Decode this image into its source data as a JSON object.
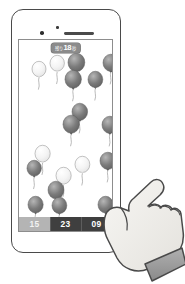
{
  "scene": {
    "device": "smartphone",
    "orientation": "portrait",
    "illustration_style": "grayscale line drawing"
  },
  "phone": {
    "sensor_icon": "proximity-sensor-dot",
    "camera_icon": "front-camera-dot",
    "speaker_icon": "earpiece-speaker-grille"
  },
  "game": {
    "title": "balloon-popping-game",
    "timer": {
      "label": "残り",
      "value": "18",
      "unit": "秒",
      "badge_color": "#8b8b8b",
      "text_color": "#ffffff"
    },
    "score_bar": {
      "background": "#3f3f3f",
      "cells": [
        {
          "value": "15",
          "state": "inactive",
          "background": "#b4b4b4"
        },
        {
          "value": "23",
          "state": "active",
          "background": "#3f3f3f"
        },
        {
          "value": "09",
          "state": "active",
          "background": "#3f3f3f"
        }
      ]
    },
    "balloon_colors": {
      "dark": "#7b7b7b",
      "dark_shade": "#5e5e5e",
      "light": "#f4f4f4",
      "light_shade": "#e2e2e2",
      "outline": "#9a9a9a",
      "string": "#a8a8a8"
    },
    "balloon_count": 21,
    "balloons": [
      {
        "id": "b01",
        "x": 13,
        "y": 22,
        "r": 7.0,
        "tone": "light"
      },
      {
        "id": "b02",
        "x": 31,
        "y": 16,
        "r": 7.2,
        "tone": "light"
      },
      {
        "id": "b03",
        "x": 49,
        "y": 14,
        "r": 8.4,
        "tone": "dark"
      },
      {
        "id": "b04",
        "x": 46,
        "y": 31,
        "r": 8.2,
        "tone": "dark"
      },
      {
        "id": "b05",
        "x": 69,
        "y": 32,
        "r": 7.4,
        "tone": "dark"
      },
      {
        "id": "b06",
        "x": 84,
        "y": 15,
        "r": 7.8,
        "tone": "dark"
      },
      {
        "id": "b07",
        "x": 53,
        "y": 64,
        "r": 7.8,
        "tone": "dark"
      },
      {
        "id": "b08",
        "x": 44,
        "y": 76,
        "r": 8.2,
        "tone": "dark"
      },
      {
        "id": "b09",
        "x": 83,
        "y": 77,
        "r": 7.8,
        "tone": "dark"
      },
      {
        "id": "b10",
        "x": 16,
        "y": 106,
        "r": 7.6,
        "tone": "light"
      },
      {
        "id": "b11",
        "x": 8,
        "y": 121,
        "r": 7.2,
        "tone": "dark"
      },
      {
        "id": "b12",
        "x": 37,
        "y": 128,
        "r": 7.6,
        "tone": "light"
      },
      {
        "id": "b13",
        "x": 56,
        "y": 117,
        "r": 7.4,
        "tone": "light"
      },
      {
        "id": "b14",
        "x": 81,
        "y": 113,
        "r": 7.8,
        "tone": "dark"
      },
      {
        "id": "b15",
        "x": 29,
        "y": 142,
        "r": 8.0,
        "tone": "dark"
      },
      {
        "id": "b16",
        "x": 9,
        "y": 157,
        "r": 7.6,
        "tone": "dark"
      },
      {
        "id": "b17",
        "x": 33,
        "y": 158,
        "r": 7.4,
        "tone": "dark"
      },
      {
        "id": "b18",
        "x": 79,
        "y": 157,
        "r": 7.6,
        "tone": "dark"
      }
    ]
  },
  "hand": {
    "gesture": "pointing-index-finger",
    "skin_color": "#f0eeea",
    "outline_color": "#4a4a4a",
    "cuff_color": "#9d9d9d"
  }
}
